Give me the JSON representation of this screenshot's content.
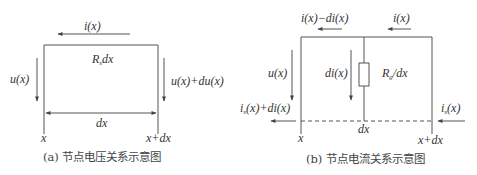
{
  "panel_a": {
    "caption": "(a) 节点电压关系示意图",
    "current_top": "i(x)",
    "resistor_label": "R",
    "resistor_sub": "s",
    "resistor_tail": "dx",
    "voltage_left": "u(x)",
    "voltage_right": "u(x)+du(x)",
    "span_label": "dx",
    "pos_left": "x",
    "pos_right": "x+dx"
  },
  "panel_b": {
    "caption": "(b) 节点电流关系示意图",
    "current_top_left": "i(x)−di(x)",
    "current_top_right": "i(x)",
    "voltage_left": "u(x)",
    "branch_current": "di(x)",
    "resistor_label": "R",
    "resistor_sub": "g",
    "resistor_tail": "/dx",
    "ground_current_left_main": "i",
    "ground_current_left_sub": "s",
    "ground_current_left_tail": "(x)+di(x)",
    "ground_current_right_main": "i",
    "ground_current_right_sub": "s",
    "ground_current_right_tail": "(x)",
    "span_label": "dx",
    "pos_left": "x",
    "pos_right": "x+dx"
  },
  "colors": {
    "line": "#555555",
    "text": "#333333"
  }
}
